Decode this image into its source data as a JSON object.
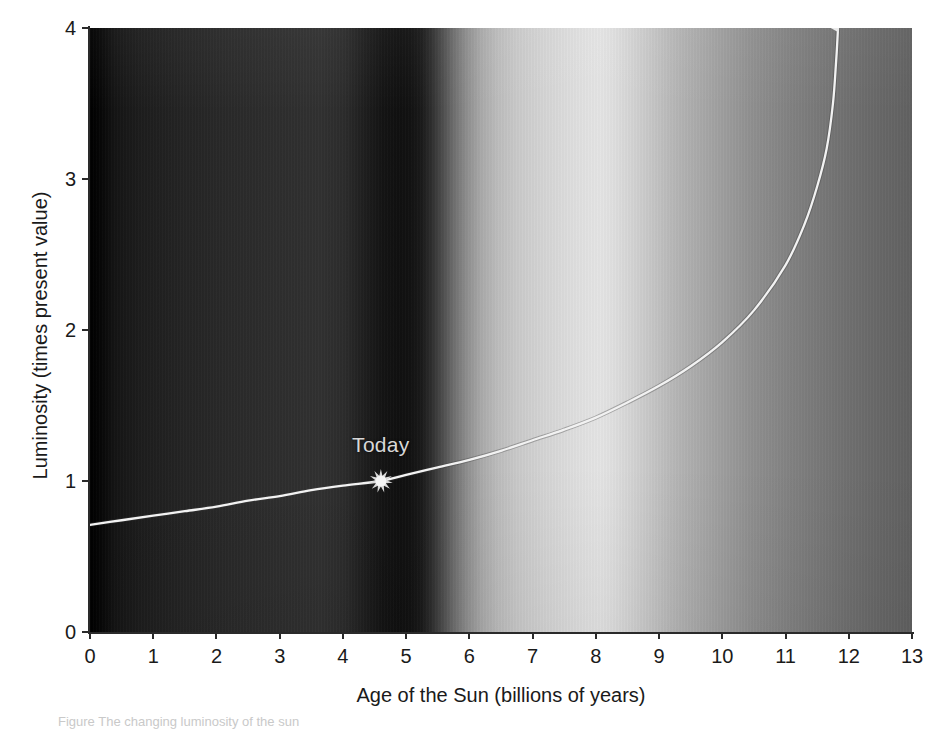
{
  "figure": {
    "caption": "Figure   The changing luminosity of the sun"
  },
  "chart_data": {
    "type": "line",
    "title": "",
    "xlabel": "Age of the Sun (billions of years)",
    "ylabel": "Luminosity (times present value)",
    "xlim": [
      0,
      13
    ],
    "ylim": [
      0,
      4
    ],
    "xticks": [
      "0",
      "1",
      "2",
      "3",
      "4",
      "5",
      "6",
      "7",
      "8",
      "9",
      "10",
      "11",
      "12",
      "13"
    ],
    "xtick_values": [
      0,
      1,
      2,
      3,
      4,
      5,
      6,
      7,
      8,
      9,
      10,
      11,
      12,
      13
    ],
    "yticks": [
      "0",
      "1",
      "2",
      "3",
      "4"
    ],
    "ytick_values": [
      0,
      1,
      2,
      3,
      4
    ],
    "grid": false,
    "legend": null,
    "series": [
      {
        "name": "Solar luminosity",
        "color": "#f2f2f2",
        "x": [
          0.0,
          0.5,
          1.0,
          1.5,
          2.0,
          2.5,
          3.0,
          3.5,
          4.0,
          4.6,
          5.0,
          5.5,
          6.0,
          6.5,
          7.0,
          7.5,
          8.0,
          8.5,
          9.0,
          9.5,
          10.0,
          10.5,
          11.0,
          11.3,
          11.5,
          11.65,
          11.75,
          11.8,
          11.82,
          11.83
        ],
        "y": [
          0.71,
          0.74,
          0.77,
          0.8,
          0.83,
          0.87,
          0.9,
          0.94,
          0.97,
          1.0,
          1.04,
          1.09,
          1.14,
          1.2,
          1.27,
          1.34,
          1.42,
          1.52,
          1.63,
          1.76,
          1.92,
          2.13,
          2.43,
          2.7,
          2.95,
          3.2,
          3.5,
          3.78,
          3.92,
          4.0
        ]
      }
    ],
    "annotations": [
      {
        "label": "Today",
        "x": 4.6,
        "y": 1.0,
        "marker": "sunburst-marker",
        "color": "#d8d8d8"
      },
      {
        "label": "",
        "x": 11.83,
        "y": 4.0,
        "marker": "up-arrow-terminator",
        "color": "#e8e8e8"
      }
    ],
    "background": {
      "description": "horizontal greyscale gradient band (dark at left, bright near 7 Gyr, mid-grey at right)",
      "stops": [
        {
          "x": 0.0,
          "color": "#000000"
        },
        {
          "x": 4.0,
          "color": "#313131"
        },
        {
          "x": 4.4,
          "color": "#141414"
        },
        {
          "x": 5.3,
          "color": "#4b4b4b"
        },
        {
          "x": 6.4,
          "color": "#bcbcbc"
        },
        {
          "x": 8.0,
          "color": "#e4e4e4"
        },
        {
          "x": 9.2,
          "color": "#bababa"
        },
        {
          "x": 11.0,
          "color": "#909090"
        },
        {
          "x": 13.0,
          "color": "#616161"
        }
      ]
    }
  }
}
